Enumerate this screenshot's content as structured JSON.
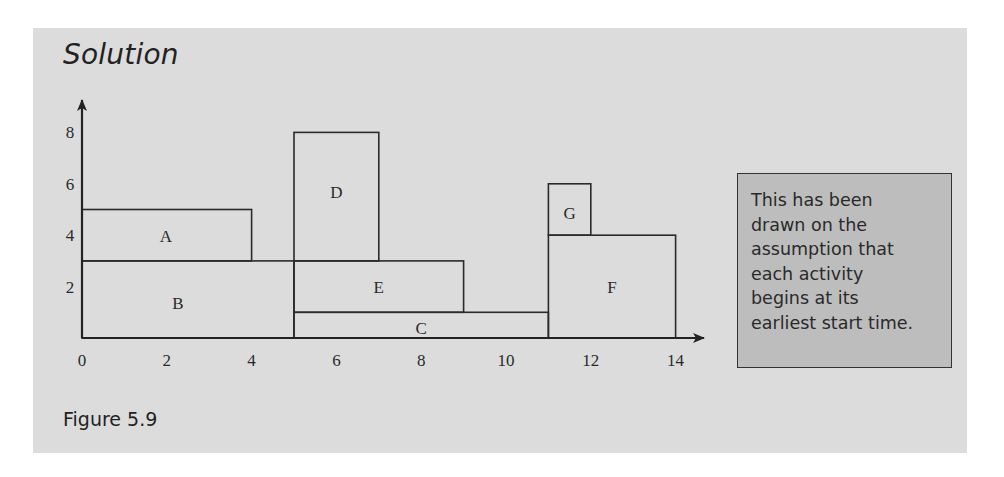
{
  "panel": {
    "title": "Solution",
    "caption": "Figure 5.9",
    "background_color": "#dcdcdc"
  },
  "callout": {
    "lines": [
      "This has been",
      "drawn on the",
      "assumption that",
      "each activity",
      "begins at its",
      "earliest start time."
    ],
    "background_color": "#bdbdbd"
  },
  "chart_data": {
    "type": "resource-histogram",
    "title": "Solution",
    "caption": "Figure 5.9",
    "xlabel": "",
    "ylabel": "",
    "x_ticks": [
      "0",
      "2",
      "4",
      "6",
      "8",
      "10",
      "12",
      "14"
    ],
    "y_ticks": [
      "2",
      "4",
      "6",
      "8"
    ],
    "xlim": [
      0,
      14
    ],
    "ylim": [
      0,
      8
    ],
    "grid": false,
    "activities": [
      {
        "label": "A",
        "start": 0,
        "end": 4,
        "bottom": 3,
        "top": 5
      },
      {
        "label": "B",
        "start": 0,
        "end": 5,
        "bottom": 0,
        "top": 3
      },
      {
        "label": "C",
        "start": 5,
        "end": 11,
        "bottom": 0,
        "top": 1
      },
      {
        "label": "D",
        "start": 5,
        "end": 7,
        "bottom": 3,
        "top": 8
      },
      {
        "label": "E",
        "start": 5,
        "end": 9,
        "bottom": 1,
        "top": 3
      },
      {
        "label": "F",
        "start": 11,
        "end": 14,
        "bottom": 0,
        "top": 4
      },
      {
        "label": "G",
        "start": 11,
        "end": 12,
        "bottom": 4,
        "top": 6
      }
    ],
    "annotation": "This has been drawn on the assumption that each activity begins at its earliest start time."
  }
}
